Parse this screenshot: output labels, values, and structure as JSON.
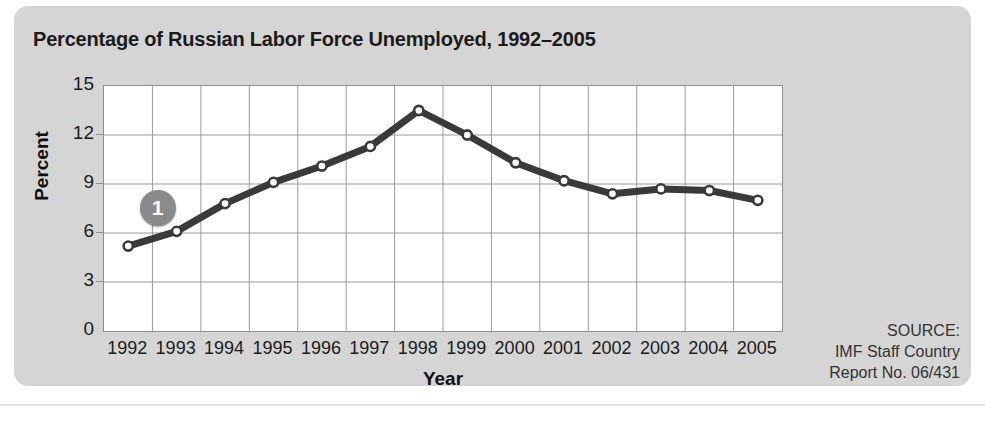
{
  "figure": {
    "title": "Percentage of Russian Labor Force Unemployed, 1992–2005",
    "callout_label": "1",
    "panel_color": "#d5d5d5",
    "line_color": "#3a3a3a",
    "grid_color": "#9a9a9a",
    "marker_fill": "#ffffff"
  },
  "source": {
    "line1": "SOURCE:",
    "line2": "IMF Staff Country",
    "line3": "Report No. 06/431"
  },
  "chart_data": {
    "type": "line",
    "title": "Percentage of Russian Labor Force Unemployed, 1992–2005",
    "xlabel": "Year",
    "ylabel": "Percent",
    "categories": [
      "1992",
      "1993",
      "1994",
      "1995",
      "1996",
      "1997",
      "1998",
      "1999",
      "2000",
      "2001",
      "2002",
      "2003",
      "2004",
      "2005"
    ],
    "values": [
      5.2,
      6.1,
      7.8,
      9.1,
      10.1,
      11.3,
      13.5,
      12.0,
      10.3,
      9.2,
      8.4,
      8.7,
      8.6,
      8.0
    ],
    "series": [
      {
        "name": "Percent of labor force unemployed",
        "values": [
          5.2,
          6.1,
          7.8,
          9.1,
          10.1,
          11.3,
          13.5,
          12.0,
          10.3,
          9.2,
          8.4,
          8.7,
          8.6,
          8.0
        ]
      }
    ],
    "ylim": [
      0,
      15
    ],
    "yticks": [
      0,
      3,
      6,
      9,
      12,
      15
    ],
    "ytick_labels": [
      "0",
      "3",
      "6",
      "9",
      "12",
      "15"
    ],
    "grid": true,
    "legend": "none",
    "annotations": [
      {
        "label": "1",
        "near_category": "1993",
        "shape": "circle-badge"
      }
    ]
  }
}
